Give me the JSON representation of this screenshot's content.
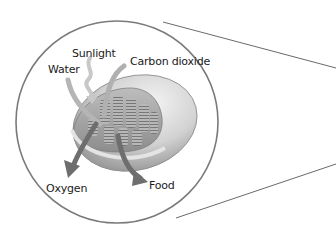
{
  "diagram": {
    "labels": {
      "sunlight": "Sunlight",
      "water": "Water",
      "carbon_dioxide": "Carbon dioxide",
      "oxygen": "Oxygen",
      "food": "Food"
    },
    "inputs": [
      "Sunlight",
      "Water",
      "Carbon dioxide"
    ],
    "outputs": [
      "Oxygen",
      "Food"
    ],
    "colors": {
      "circle_stroke": "#7a7a7a",
      "arrow_fill": "#6e6e6e",
      "chloroplast_fill": "#d8d8d8",
      "text": "#1a1a1a"
    }
  }
}
